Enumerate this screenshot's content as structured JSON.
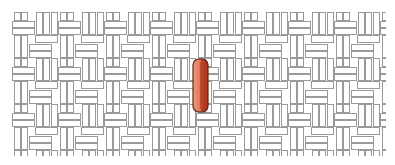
{
  "scene": {
    "background_color": "#ffffff",
    "pattern": {
      "name": "basketweave-tile-pattern",
      "stroke_color": "#9a9a9a",
      "fill_color": "#ffffff",
      "region": {
        "x": 12,
        "y": 12,
        "width": 374,
        "height": 144
      }
    },
    "highlight": {
      "name": "orange-capsule",
      "light_color": "#e8866a",
      "dark_color": "#b9391d",
      "outline_color": "#5a2a1a",
      "x": 192,
      "y": 58,
      "width": 17,
      "height": 55
    }
  }
}
